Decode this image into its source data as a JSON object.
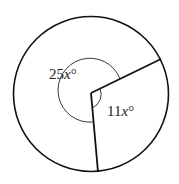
{
  "diagram": {
    "type": "circle-with-central-angles",
    "angles": [
      {
        "id": "major",
        "label_num": "25",
        "label_var": "x",
        "label_unit": "°"
      },
      {
        "id": "minor",
        "label_num": "11",
        "label_var": "x",
        "label_unit": "°"
      }
    ],
    "colors": {
      "stroke": "#111111",
      "background": "#ffffff"
    }
  }
}
